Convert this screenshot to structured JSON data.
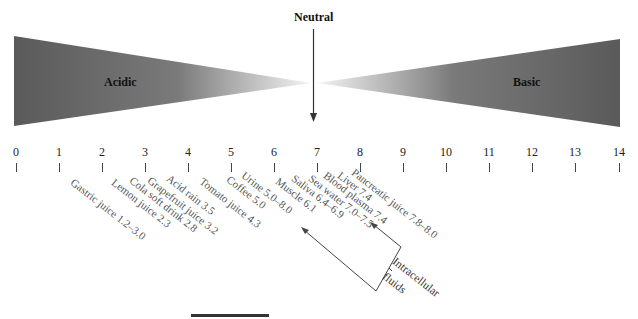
{
  "diagram": {
    "neutral_label": "Neutral",
    "acidic_label": "Acidic",
    "basic_label": "Basic",
    "scale_ticks": [
      "0",
      "1",
      "2",
      "3",
      "4",
      "5",
      "6",
      "7",
      "8",
      "9",
      "10",
      "11",
      "12",
      "13",
      "14"
    ],
    "samples": [
      {
        "label": "Gastric juice 1.2–3.0"
      },
      {
        "label": "Lemon juice 2.3"
      },
      {
        "label": "Cola soft drink 2.8"
      },
      {
        "label": "Grapefruit juice 3.2"
      },
      {
        "label": "Acid rain 3.5"
      },
      {
        "label": "Tomato juice 4.3"
      },
      {
        "label": "Coffee 5.0"
      },
      {
        "label": "Urine 5.0–8.0"
      },
      {
        "label": "Muscle 6.1"
      },
      {
        "label": "Saliva 6.4–6.9"
      },
      {
        "label": "Sea water 7.0–7.5"
      },
      {
        "label": "Blood plasma 7.4"
      },
      {
        "label": "Liver 7.4"
      },
      {
        "label": "Pancreatic juice 7.8–8.0"
      }
    ],
    "bracket": {
      "line1": "Intracellular",
      "line2": "fluids"
    },
    "colors": {
      "wedge_dark": "#5a5a5a",
      "wedge_light": "#ffffff",
      "text": "#222222",
      "sample_text": "#555555"
    }
  }
}
